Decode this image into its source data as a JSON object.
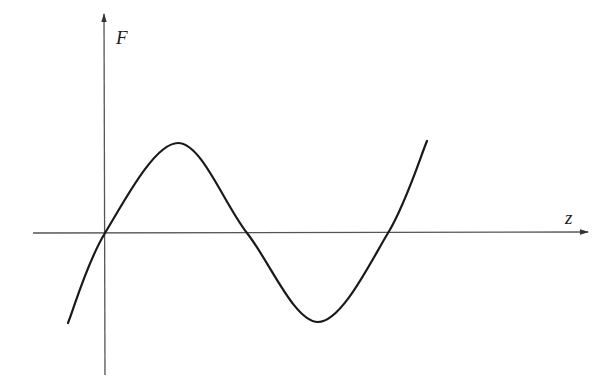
{
  "diagram": {
    "type": "function-plot",
    "axes": {
      "x_label": "z",
      "y_label": "F",
      "origin_px": [
        105,
        233
      ],
      "x_axis_px": {
        "from": 33,
        "to": 588
      },
      "y_axis_px": {
        "from": 375,
        "to": 12
      },
      "axis_color": "#555555"
    },
    "curve": {
      "color": "#1a1a1a",
      "description": "oscillating curve through origin: rises to a maximum, crosses zero, falls to a minimum, then rises again",
      "key_points_px": [
        {
          "label": "start",
          "x": 68,
          "y": 323
        },
        {
          "label": "zero-origin",
          "x": 105,
          "y": 233
        },
        {
          "label": "maximum",
          "x": 178,
          "y": 143
        },
        {
          "label": "zero-middle",
          "x": 247,
          "y": 233
        },
        {
          "label": "minimum",
          "x": 318,
          "y": 322
        },
        {
          "label": "zero-right",
          "x": 388,
          "y": 233
        },
        {
          "label": "end",
          "x": 427,
          "y": 141
        }
      ]
    }
  }
}
